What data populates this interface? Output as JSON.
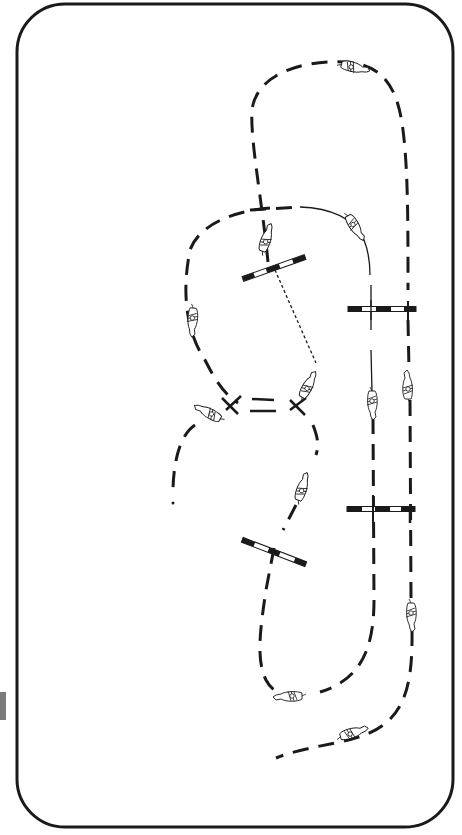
{
  "diagram": {
    "type": "jumping exercise plan",
    "colors": {
      "background": "#ffffff",
      "arena_border": "#1a1a1a",
      "track": "#1a1a1a",
      "pole_dark": "#1a1a1a",
      "pole_light": "#ffffff",
      "edge_tab": "#7a7a7a"
    },
    "arena": {
      "x": 17,
      "y": 4,
      "width": 436,
      "height": 823,
      "corner_radius": 48,
      "stroke_width": 3
    },
    "edge_tab": {
      "y": 692,
      "height": 28
    },
    "jumps": [
      {
        "id": "jump-upper-left-diagonal",
        "x1": 243,
        "y1": 279,
        "x2": 305,
        "y2": 257
      },
      {
        "id": "jump-upper-right-vertical-pole",
        "x1": 348,
        "y1": 309,
        "x2": 416,
        "y2": 309
      },
      {
        "id": "jump-lower-right-vertical-pole",
        "x1": 347,
        "y1": 509,
        "x2": 415,
        "y2": 509
      },
      {
        "id": "jump-lower-left-diagonal",
        "x1": 243,
        "y1": 540,
        "x2": 306,
        "y2": 564
      }
    ],
    "horses": [
      {
        "id": "horse-top",
        "x": 355,
        "y": 68,
        "angle": 15
      },
      {
        "id": "horse-upper-curve",
        "x": 355,
        "y": 228,
        "angle": 60
      },
      {
        "id": "horse-approach-jump1",
        "x": 267,
        "y": 240,
        "angle": -70
      },
      {
        "id": "horse-left-loop",
        "x": 192,
        "y": 320,
        "angle": 95
      },
      {
        "id": "horse-center-right",
        "x": 309,
        "y": 385,
        "angle": -60
      },
      {
        "id": "horse-center-left",
        "x": 207,
        "y": 411,
        "angle": -150
      },
      {
        "id": "horse-inner-right-lane",
        "x": 372,
        "y": 405,
        "angle": 90
      },
      {
        "id": "horse-outer-right-lane",
        "x": 408,
        "y": 385,
        "angle": -90
      },
      {
        "id": "horse-lower-center",
        "x": 303,
        "y": 487,
        "angle": -70
      },
      {
        "id": "horse-outer-right-low",
        "x": 411,
        "y": 617,
        "angle": 90
      },
      {
        "id": "horse-bottom-inner",
        "x": 288,
        "y": 696,
        "angle": 180
      },
      {
        "id": "horse-bottom-outer",
        "x": 354,
        "y": 733,
        "angle": -15
      }
    ]
  }
}
